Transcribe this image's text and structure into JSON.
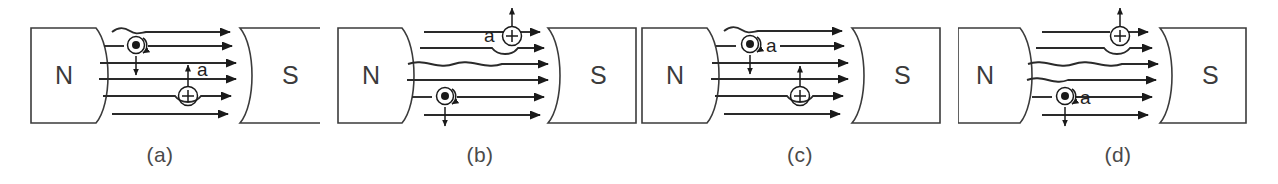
{
  "figure": {
    "background_color": "#ffffff",
    "line_color": "#2a2a2a",
    "label_color": "#3b3b3b",
    "caption_color": "#4a4a4a",
    "field_line_count": 6,
    "field_direction": "left-to-right (N to S)"
  },
  "panels": [
    {
      "id": "a",
      "caption": "(a)",
      "north_label": "N",
      "south_label": "S",
      "acceleration_label": "a",
      "charges": [
        {
          "type": "negative",
          "symbol": "dot",
          "symbol_name": "electron-into-page-dot",
          "position": "upper-left",
          "arrow_direction": "down",
          "spin_arc": "counterclockwise",
          "has_a_label": false
        },
        {
          "type": "positive",
          "symbol": "+",
          "symbol_name": "proton-plus-circle",
          "position": "lower-right",
          "arrow_direction": "up",
          "spin_arc": "none",
          "has_a_label": true,
          "a_label_side": "right"
        }
      ]
    },
    {
      "id": "b",
      "caption": "(b)",
      "north_label": "N",
      "south_label": "S",
      "acceleration_label": "a",
      "charges": [
        {
          "type": "positive",
          "symbol": "+",
          "symbol_name": "proton-plus-circle",
          "position": "upper-right",
          "arrow_direction": "up",
          "spin_arc": "none",
          "has_a_label": true,
          "a_label_side": "left"
        },
        {
          "type": "negative",
          "symbol": "dot",
          "symbol_name": "electron-into-page-dot",
          "position": "lower-left",
          "arrow_direction": "down",
          "spin_arc": "counterclockwise",
          "has_a_label": false
        }
      ]
    },
    {
      "id": "c",
      "caption": "(c)",
      "north_label": "N",
      "south_label": "S",
      "acceleration_label": "a",
      "charges": [
        {
          "type": "negative",
          "symbol": "dot",
          "symbol_name": "electron-into-page-dot",
          "position": "upper-left",
          "arrow_direction": "down",
          "spin_arc": "counterclockwise",
          "has_a_label": true,
          "a_label_side": "right"
        },
        {
          "type": "positive",
          "symbol": "+",
          "symbol_name": "proton-plus-circle",
          "position": "lower-right",
          "arrow_direction": "up",
          "spin_arc": "none",
          "has_a_label": false
        }
      ]
    },
    {
      "id": "d",
      "caption": "(d)",
      "north_label": "N",
      "south_label": "S",
      "acceleration_label": "a",
      "charges": [
        {
          "type": "positive",
          "symbol": "+",
          "symbol_name": "proton-plus-circle",
          "position": "upper-right",
          "arrow_direction": "up",
          "spin_arc": "none",
          "has_a_label": false
        },
        {
          "type": "negative",
          "symbol": "dot",
          "symbol_name": "electron-into-page-dot",
          "position": "lower-left",
          "arrow_direction": "down",
          "spin_arc": "counterclockwise",
          "has_a_label": true,
          "a_label_side": "right"
        }
      ]
    }
  ]
}
